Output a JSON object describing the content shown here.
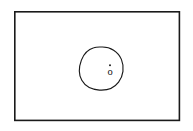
{
  "figure": {
    "title": "",
    "background_color": "#ffffff",
    "line_color": "#1a1a1a",
    "frame": {
      "name": "outer-rectangle",
      "x": 14,
      "y": 11,
      "width": 166,
      "height": 110,
      "stroke_width": 1.6,
      "fill": "#ffffff"
    },
    "blob": {
      "name": "closed-region",
      "description": "irregular hand-drawn closed oval region",
      "bounds": {
        "x": 80,
        "y": 47,
        "width": 43,
        "height": 43
      },
      "stroke_width": 1.15
    },
    "point": {
      "name": "interior-point",
      "label": "o",
      "dot": true,
      "x": 110,
      "y": 71,
      "dot_x": 110,
      "dot_y": 65.2,
      "dot_radius": 0.95,
      "font_size": 10.5,
      "color": "#111111"
    }
  }
}
